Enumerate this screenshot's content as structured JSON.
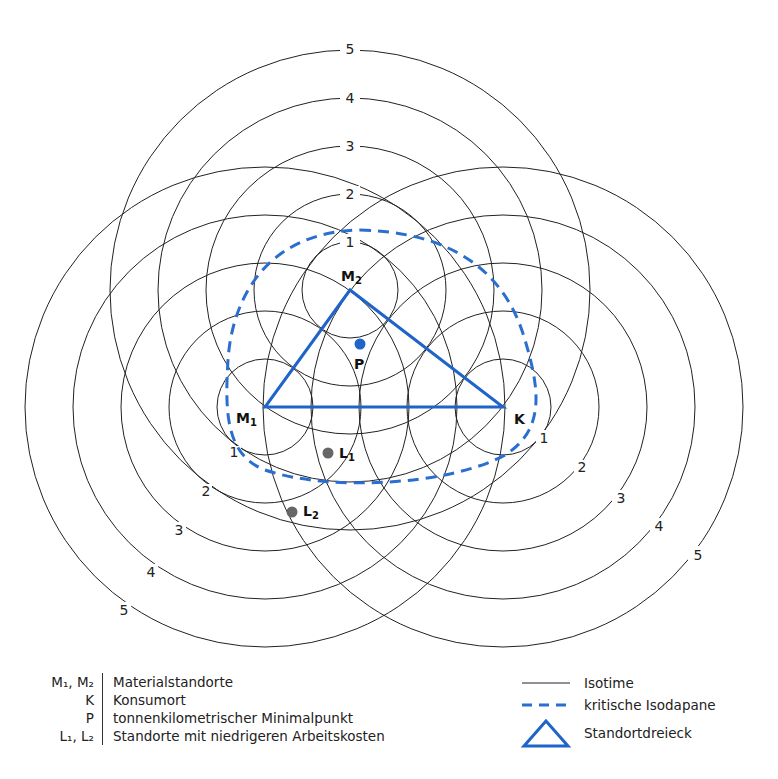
{
  "diagram": {
    "points": {
      "M1": {
        "label": "M",
        "sub": "1",
        "x": 265,
        "y": 407
      },
      "M2": {
        "label": "M",
        "sub": "2",
        "x": 350,
        "y": 290
      },
      "K": {
        "label": "K",
        "x": 503,
        "y": 407
      },
      "P": {
        "label": "P",
        "x": 360,
        "y": 344
      },
      "L1": {
        "label": "L",
        "sub": "1",
        "x": 328,
        "y": 453
      },
      "L2": {
        "label": "L",
        "sub": "2",
        "x": 292,
        "y": 512
      }
    },
    "isotime_levels": [
      "1",
      "2",
      "3",
      "4",
      "5"
    ],
    "isotime_step_px": 48,
    "colors": {
      "triangle": "#1f64c8",
      "isodapane": "#2a6fd0",
      "P": "#1f64c8",
      "L": "#666666",
      "isotime": "#222222"
    }
  },
  "legend": {
    "left": [
      {
        "symbol": "M₁, M₂",
        "text": "Materialstandorte"
      },
      {
        "symbol": "K",
        "text": "Konsumort"
      },
      {
        "symbol": "P",
        "text": "tonnenkilometrischer Minimalpunkt"
      },
      {
        "symbol": "L₁, L₂",
        "text": "Standorte mit niedrigeren Arbeitskosten"
      }
    ],
    "right": [
      {
        "symbol": "solid-line",
        "text": "Isotime"
      },
      {
        "symbol": "dashed-line",
        "text": "kritische Isodapane"
      },
      {
        "symbol": "triangle",
        "text": "Standortdreieck"
      }
    ]
  }
}
